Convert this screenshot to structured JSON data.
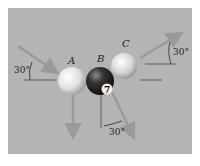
{
  "figure": {
    "background_color": "#b4b4b4",
    "arrow_color": "#9a9a9a",
    "balls": [
      {
        "label": "A",
        "color": "#e8e8e8",
        "number": ""
      },
      {
        "label": "B",
        "color": "#2a2a2a",
        "number": "7"
      },
      {
        "label": "C",
        "color": "#e0e0e0",
        "number": ""
      }
    ],
    "angles": [
      {
        "id": "incoming-A",
        "text": "30°"
      },
      {
        "id": "outgoing-C",
        "text": "30°"
      },
      {
        "id": "outgoing-B",
        "text": "30°"
      }
    ]
  }
}
